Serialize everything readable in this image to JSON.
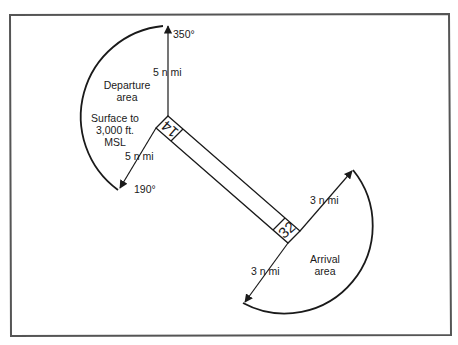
{
  "diagram": {
    "frame": {
      "x1": 10,
      "y1": 15,
      "x2": 450,
      "y2": 335,
      "color": "#555555"
    },
    "runway": {
      "end_a_label": "14",
      "end_b_label": "32",
      "corners": [
        [
          168,
          116
        ],
        [
          300,
          231
        ],
        [
          288,
          243
        ],
        [
          156,
          128
        ]
      ]
    },
    "departure": {
      "title_line1": "Departure",
      "title_line2": "area",
      "altitude_line1": "Surface to",
      "altitude_line2": "3,000 ft.",
      "altitude_line3": "MSL",
      "distance_top": "5 n mi",
      "distance_bottom": "5 n mi",
      "bearing_top": "350°",
      "bearing_bottom": "190°"
    },
    "arrival": {
      "title_line1": "Arrival",
      "title_line2": "area",
      "distance_top": "3 n mi",
      "distance_bottom": "3 n mi"
    }
  }
}
